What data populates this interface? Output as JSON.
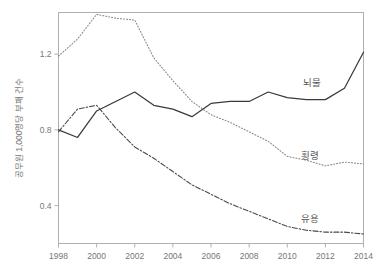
{
  "chart_data": {
    "type": "line",
    "title": "",
    "subtitle": "",
    "xlabel": "",
    "ylabel": "공무원 1,000명당 부패 건수",
    "xlim": [
      1998,
      2014
    ],
    "ylim": [
      0.2,
      1.42
    ],
    "grid": false,
    "legend_position": "inline-right",
    "xticks": [
      "1998",
      "2000",
      "2002",
      "2004",
      "2006",
      "2008",
      "2010",
      "2012",
      "2014"
    ],
    "xtick_values": [
      1998,
      2000,
      2002,
      2004,
      2006,
      2008,
      2010,
      2012,
      2014
    ],
    "yticks": [
      "0.4",
      "0.8",
      "1.2"
    ],
    "ytick_values": [
      0.4,
      0.8,
      1.2
    ],
    "x": [
      1998,
      1999,
      2000,
      2001,
      2002,
      2003,
      2004,
      2005,
      2006,
      2007,
      2008,
      2009,
      2010,
      2011,
      2012,
      2013,
      2014
    ],
    "series": [
      {
        "name": "뇌물",
        "label": "뇌물",
        "style": "solid",
        "color": "#3a3a3a",
        "label_x": 2011.3,
        "label_y": 1.05,
        "values": [
          0.8,
          0.76,
          0.9,
          0.95,
          1.0,
          0.93,
          0.91,
          0.87,
          0.94,
          0.95,
          0.95,
          1.0,
          0.97,
          0.96,
          0.96,
          1.02,
          1.21
        ]
      },
      {
        "name": "횡령",
        "label": "횡령",
        "style": "dotted",
        "color": "#8a8a8a",
        "label_x": 2011.2,
        "label_y": 0.66,
        "values": [
          1.19,
          1.28,
          1.41,
          1.39,
          1.38,
          1.18,
          1.06,
          0.95,
          0.88,
          0.84,
          0.79,
          0.74,
          0.66,
          0.64,
          0.61,
          0.63,
          0.62
        ]
      },
      {
        "name": "유용",
        "label": "유용",
        "style": "dashdot",
        "color": "#4a4a4a",
        "label_x": 2011.2,
        "label_y": 0.33,
        "values": [
          0.79,
          0.91,
          0.93,
          0.81,
          0.71,
          0.65,
          0.58,
          0.51,
          0.46,
          0.41,
          0.37,
          0.33,
          0.29,
          0.27,
          0.26,
          0.26,
          0.25
        ]
      }
    ]
  },
  "axis": {
    "ylabel": "공무원 1,000명당 부패 건수"
  }
}
